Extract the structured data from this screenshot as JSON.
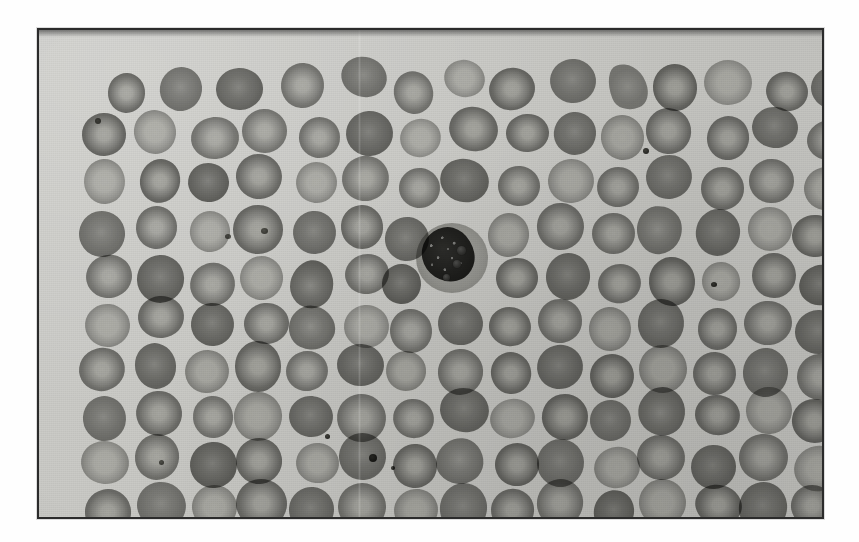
{
  "page": {
    "background_color": "#fefefe",
    "width": 859,
    "height": 542
  },
  "figure": {
    "type": "photomicrograph",
    "caption": "",
    "frame": {
      "border_color": "#2b2b2b",
      "x": 37,
      "y": 28,
      "width": 787,
      "height": 491
    },
    "field": {
      "background_color": "#c7c7c3",
      "stain": "",
      "label": ""
    },
    "specimen": {
      "background_color": "#c7c7c3",
      "cell_color": "#7a7a77",
      "dense_cell_color": "#6d6d6a",
      "pale_cell_color": "#a3a3a0",
      "nucleus_color": "#302f2d",
      "granule_color": "#2e2e2c",
      "platelet_color": "#3a3a36"
    },
    "features": {
      "erythrocyte_count_visible": 118,
      "leukocyte_count_visible": 1,
      "platelet_count_visible": 9,
      "leukocyte_type_label": "",
      "leukocyte_granules": 3
    }
  },
  "cells": {
    "rbc": [
      [
        66,
        42,
        40,
        40,
        "rbc"
      ],
      [
        120,
        34,
        44,
        43,
        "rbc-dense"
      ],
      [
        176,
        38,
        48,
        42,
        "rbc-dense"
      ],
      [
        244,
        36,
        44,
        44,
        "rbc"
      ],
      [
        299,
        30,
        48,
        38,
        "rbc-dense"
      ],
      [
        355,
        40,
        42,
        42,
        "rbc"
      ],
      [
        404,
        32,
        40,
        40,
        "rbc-pale"
      ],
      [
        453,
        36,
        46,
        44,
        "rbc"
      ],
      [
        510,
        32,
        44,
        42,
        "rbc-dense"
      ],
      [
        566,
        40,
        46,
        38,
        "frag"
      ],
      [
        612,
        36,
        44,
        44,
        "rbc"
      ],
      [
        668,
        30,
        46,
        44,
        "rbc-pale"
      ],
      [
        724,
        40,
        42,
        42,
        "rbc"
      ],
      [
        772,
        34,
        44,
        44,
        "rbc-dense"
      ],
      [
        44,
        86,
        42,
        42,
        "rbc"
      ],
      [
        98,
        80,
        44,
        44,
        "rbc-pale"
      ],
      [
        152,
        84,
        46,
        44,
        "rbc"
      ],
      [
        205,
        78,
        44,
        46,
        "rbc"
      ],
      [
        258,
        88,
        42,
        40,
        "rbc"
      ],
      [
        308,
        82,
        46,
        44,
        "rbc-dense"
      ],
      [
        362,
        88,
        40,
        40,
        "rbc-pale"
      ],
      [
        410,
        78,
        46,
        46,
        "rbc"
      ],
      [
        464,
        86,
        40,
        40,
        "rbc"
      ],
      [
        512,
        80,
        44,
        44,
        "rbc-dense"
      ],
      [
        562,
        86,
        42,
        42,
        "rbc-pale"
      ],
      [
        610,
        78,
        46,
        46,
        "rbc"
      ],
      [
        666,
        84,
        40,
        42,
        "rbc"
      ],
      [
        712,
        80,
        46,
        44,
        "rbc-dense"
      ],
      [
        766,
        88,
        44,
        42,
        "rbc"
      ],
      [
        46,
        132,
        44,
        44,
        "rbc-pale"
      ],
      [
        100,
        128,
        42,
        42,
        "rbc"
      ],
      [
        150,
        136,
        44,
        42,
        "rbc-dense"
      ],
      [
        200,
        126,
        48,
        46,
        "rbc"
      ],
      [
        256,
        134,
        42,
        42,
        "rbc-pale"
      ],
      [
        304,
        128,
        46,
        44,
        "rbc"
      ],
      [
        358,
        136,
        40,
        40,
        "rbc"
      ],
      [
        404,
        126,
        46,
        46,
        "rbc-dense"
      ],
      [
        458,
        134,
        42,
        42,
        "rbc"
      ],
      [
        506,
        128,
        44,
        44,
        "rbc-pale"
      ],
      [
        556,
        136,
        42,
        40,
        "rbc"
      ],
      [
        604,
        126,
        48,
        46,
        "rbc-dense"
      ],
      [
        660,
        134,
        42,
        42,
        "rbc"
      ],
      [
        708,
        128,
        44,
        44,
        "rbc"
      ],
      [
        762,
        134,
        46,
        44,
        "rbc-pale"
      ],
      [
        42,
        180,
        46,
        44,
        "rbc-dense"
      ],
      [
        96,
        176,
        44,
        44,
        "rbc"
      ],
      [
        148,
        184,
        42,
        40,
        "rbc-pale"
      ],
      [
        196,
        174,
        48,
        48,
        "rbc"
      ],
      [
        252,
        182,
        44,
        42,
        "rbc-dense"
      ],
      [
        302,
        176,
        42,
        42,
        "rbc"
      ],
      [
        348,
        184,
        44,
        42,
        "rbc-dense"
      ],
      [
        452,
        180,
        40,
        42,
        "rbc-pale"
      ],
      [
        498,
        174,
        46,
        46,
        "rbc"
      ],
      [
        552,
        184,
        42,
        40,
        "rbc"
      ],
      [
        598,
        176,
        48,
        48,
        "rbc-irreg"
      ],
      [
        654,
        182,
        44,
        44,
        "rbc-dense"
      ],
      [
        706,
        176,
        42,
        42,
        "rbc-pale"
      ],
      [
        754,
        184,
        48,
        44,
        "rbc"
      ],
      [
        44,
        228,
        44,
        44,
        "rbc"
      ],
      [
        98,
        222,
        46,
        46,
        "rbc-dense"
      ],
      [
        152,
        230,
        42,
        40,
        "rbc"
      ],
      [
        200,
        224,
        44,
        44,
        "rbc-pale"
      ],
      [
        250,
        232,
        46,
        42,
        "rbc-irreg"
      ],
      [
        304,
        226,
        42,
        42,
        "rbc"
      ],
      [
        344,
        234,
        40,
        40,
        "rbc-dense"
      ],
      [
        458,
        230,
        44,
        42,
        "rbc"
      ],
      [
        504,
        224,
        46,
        46,
        "rbc-dense"
      ],
      [
        560,
        232,
        44,
        42,
        "rbc"
      ],
      [
        608,
        226,
        48,
        46,
        "rbc"
      ],
      [
        664,
        234,
        40,
        40,
        "rbc-pale"
      ],
      [
        710,
        226,
        46,
        46,
        "rbc"
      ],
      [
        760,
        232,
        46,
        42,
        "rbc-dense"
      ],
      [
        46,
        274,
        44,
        44,
        "rbc-pale"
      ],
      [
        100,
        268,
        44,
        44,
        "rbc"
      ],
      [
        150,
        276,
        46,
        44,
        "rbc-dense"
      ],
      [
        202,
        270,
        42,
        42,
        "rbc"
      ],
      [
        248,
        278,
        46,
        42,
        "rbc-irreg"
      ],
      [
        302,
        272,
        44,
        44,
        "rbc-pale"
      ],
      [
        350,
        278,
        42,
        42,
        "rbc"
      ],
      [
        398,
        270,
        44,
        44,
        "rbc-dense"
      ],
      [
        448,
        278,
        42,
        40,
        "rbc"
      ],
      [
        496,
        272,
        46,
        46,
        "rbc"
      ],
      [
        552,
        280,
        44,
        42,
        "rbc-pale"
      ],
      [
        602,
        272,
        46,
        46,
        "rbc-dense"
      ],
      [
        656,
        280,
        42,
        40,
        "rbc"
      ],
      [
        704,
        272,
        46,
        46,
        "rbc"
      ],
      [
        756,
        278,
        48,
        44,
        "rbc-dense"
      ],
      [
        42,
        320,
        46,
        44,
        "rbc"
      ],
      [
        96,
        314,
        44,
        44,
        "rbc-dense"
      ],
      [
        148,
        322,
        42,
        42,
        "rbc-pale"
      ],
      [
        194,
        314,
        48,
        48,
        "rbc"
      ],
      [
        250,
        322,
        44,
        42,
        "rbc"
      ],
      [
        300,
        316,
        44,
        44,
        "rbc-dense"
      ],
      [
        348,
        324,
        42,
        40,
        "rbc-pale"
      ],
      [
        396,
        316,
        46,
        46,
        "rbc"
      ],
      [
        450,
        324,
        42,
        42,
        "rbc"
      ],
      [
        498,
        316,
        46,
        46,
        "rbc-dense"
      ],
      [
        552,
        324,
        44,
        42,
        "rbc"
      ],
      [
        600,
        316,
        46,
        46,
        "rbc-pale"
      ],
      [
        654,
        324,
        44,
        42,
        "rbc"
      ],
      [
        702,
        316,
        46,
        46,
        "rbc-dense"
      ],
      [
        756,
        322,
        46,
        44,
        "rbc"
      ],
      [
        44,
        366,
        44,
        44,
        "rbc-dense"
      ],
      [
        98,
        360,
        46,
        46,
        "rbc"
      ],
      [
        152,
        368,
        42,
        40,
        "rbc"
      ],
      [
        198,
        360,
        46,
        46,
        "rbc-pale"
      ],
      [
        252,
        368,
        44,
        42,
        "rbc-dense"
      ],
      [
        300,
        362,
        46,
        46,
        "rbc"
      ],
      [
        354,
        368,
        42,
        42,
        "rbc"
      ],
      [
        400,
        360,
        46,
        46,
        "rbc-dense"
      ],
      [
        452,
        368,
        44,
        42,
        "rbc-pale"
      ],
      [
        500,
        362,
        46,
        46,
        "rbc"
      ],
      [
        554,
        370,
        42,
        40,
        "rbc-dense"
      ],
      [
        598,
        360,
        50,
        48,
        "rbc-irreg"
      ],
      [
        656,
        368,
        44,
        42,
        "rbc"
      ],
      [
        704,
        360,
        46,
        46,
        "rbc-pale"
      ],
      [
        756,
        368,
        46,
        44,
        "rbc"
      ],
      [
        42,
        412,
        46,
        46,
        "rbc-pale"
      ],
      [
        98,
        406,
        44,
        44,
        "rbc"
      ],
      [
        148,
        414,
        46,
        44,
        "rbc-dense"
      ],
      [
        200,
        406,
        46,
        46,
        "rbc"
      ],
      [
        254,
        414,
        42,
        42,
        "rbc-pale"
      ],
      [
        300,
        406,
        48,
        48,
        "rbc-dense"
      ],
      [
        356,
        414,
        42,
        42,
        "rbc"
      ],
      [
        400,
        406,
        48,
        46,
        "rbc-irreg"
      ],
      [
        456,
        414,
        42,
        42,
        "rbc"
      ],
      [
        500,
        406,
        46,
        46,
        "rbc-dense"
      ],
      [
        552,
        414,
        44,
        42,
        "rbc-pale"
      ],
      [
        600,
        406,
        46,
        46,
        "rbc"
      ],
      [
        654,
        414,
        44,
        44,
        "rbc-dense"
      ],
      [
        702,
        406,
        46,
        46,
        "rbc"
      ],
      [
        754,
        414,
        48,
        44,
        "rbc-pale"
      ],
      [
        46,
        456,
        44,
        44,
        "rbc"
      ],
      [
        98,
        452,
        46,
        44,
        "rbc-dense"
      ],
      [
        150,
        458,
        44,
        42,
        "rbc-pale"
      ],
      [
        198,
        450,
        48,
        48,
        "rbc"
      ],
      [
        252,
        458,
        44,
        42,
        "rbc-dense"
      ],
      [
        300,
        450,
        46,
        46,
        "rbc"
      ],
      [
        352,
        458,
        44,
        42,
        "rbc-pale"
      ],
      [
        398,
        450,
        48,
        48,
        "rbc-dense"
      ],
      [
        454,
        458,
        42,
        42,
        "rbc"
      ],
      [
        498,
        450,
        48,
        48,
        "rbc"
      ],
      [
        554,
        458,
        42,
        42,
        "rbc-dense"
      ],
      [
        598,
        450,
        48,
        48,
        "rbc-pale"
      ],
      [
        654,
        458,
        44,
        42,
        "rbc"
      ],
      [
        700,
        450,
        48,
        48,
        "rbc-dense"
      ],
      [
        754,
        458,
        46,
        44,
        "rbc"
      ]
    ],
    "platelets": [
      [
        56,
        88,
        6,
        6,
        "soft"
      ],
      [
        222,
        198,
        7,
        6,
        "soft"
      ],
      [
        604,
        118,
        6,
        6,
        ""
      ],
      [
        286,
        404,
        5,
        5,
        ""
      ],
      [
        330,
        424,
        8,
        8,
        ""
      ],
      [
        352,
        436,
        4,
        4,
        ""
      ],
      [
        186,
        204,
        6,
        5,
        "soft"
      ],
      [
        672,
        252,
        6,
        5,
        ""
      ],
      [
        120,
        430,
        5,
        5,
        "soft"
      ]
    ],
    "granules": [
      [
        418,
        216,
        9,
        9
      ],
      [
        414,
        230,
        8,
        8
      ],
      [
        404,
        244,
        7,
        7
      ]
    ]
  }
}
